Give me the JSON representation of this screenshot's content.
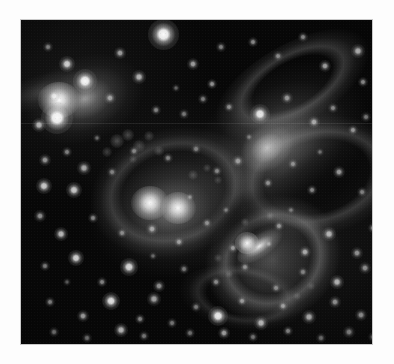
{
  "page": {
    "background_color": "#fdfdfd",
    "width": 394,
    "height": 364,
    "caption": ""
  },
  "image": {
    "alt_text": "Grayscale astronomical image of an interacting group of galaxies in a dense star field",
    "frame": {
      "x": 20,
      "y": 19,
      "width": 353,
      "height": 326
    },
    "border_color": "#c9c9c9",
    "background_color": "#070707",
    "palette": {
      "sky_black": "#070707",
      "faint_nebulosity": "#3a3a3a",
      "mid_gray": "#8e8e8e",
      "bright_gray": "#cfcfcf",
      "star_white": "#ffffff"
    },
    "scan_artifacts": {
      "vertical_striping": true,
      "horizontal_seam_y": 103,
      "grain": true,
      "vignette": true
    },
    "galaxies": [
      {
        "name": "elliptical-upper-left",
        "type": "elliptical",
        "center": {
          "x": 56,
          "y": 79
        },
        "radius": {
          "x": 62,
          "y": 42
        },
        "rotation_deg": -22,
        "core_brightness": "very-bright",
        "has_tidal_tail": true
      },
      {
        "name": "spiral-upper-right",
        "type": "spiral",
        "center": {
          "x": 243,
          "y": 128
        },
        "radius": {
          "x": 86,
          "y": 58
        },
        "rotation_deg": -38,
        "core_brightness": "diffuse-bright",
        "has_tidal_tail": true
      },
      {
        "name": "interacting-pair-center-a",
        "type": "interacting-core",
        "center": {
          "x": 128,
          "y": 184
        },
        "radius": {
          "x": 18,
          "y": 15
        },
        "rotation_deg": 0,
        "core_brightness": "very-bright",
        "has_tidal_tail": false
      },
      {
        "name": "interacting-pair-center-b",
        "type": "interacting-core",
        "center": {
          "x": 156,
          "y": 189
        },
        "radius": {
          "x": 17,
          "y": 14
        },
        "rotation_deg": 0,
        "core_brightness": "very-bright",
        "has_tidal_tail": false
      },
      {
        "name": "barred-spiral-lower-right",
        "type": "barred-spiral",
        "center": {
          "x": 243,
          "y": 234
        },
        "radius": {
          "x": 72,
          "y": 62
        },
        "rotation_deg": -30,
        "core_brightness": "bright",
        "has_tidal_tail": true
      }
    ],
    "stars": [
      {
        "x": 142,
        "y": 14,
        "r": 5.0,
        "b": 1.0
      },
      {
        "x": 46,
        "y": 44,
        "r": 2.6,
        "b": 0.82
      },
      {
        "x": 99,
        "y": 33,
        "r": 1.8,
        "b": 0.62
      },
      {
        "x": 118,
        "y": 57,
        "r": 2.2,
        "b": 0.7
      },
      {
        "x": 172,
        "y": 44,
        "r": 1.9,
        "b": 0.62
      },
      {
        "x": 191,
        "y": 64,
        "r": 1.7,
        "b": 0.58
      },
      {
        "x": 200,
        "y": 27,
        "r": 1.5,
        "b": 0.5
      },
      {
        "x": 232,
        "y": 22,
        "r": 1.6,
        "b": 0.54
      },
      {
        "x": 257,
        "y": 36,
        "r": 1.5,
        "b": 0.48
      },
      {
        "x": 282,
        "y": 17,
        "r": 1.6,
        "b": 0.52
      },
      {
        "x": 304,
        "y": 46,
        "r": 2.0,
        "b": 0.62
      },
      {
        "x": 337,
        "y": 31,
        "r": 2.4,
        "b": 0.74
      },
      {
        "x": 342,
        "y": 62,
        "r": 1.7,
        "b": 0.56
      },
      {
        "x": 27,
        "y": 27,
        "r": 1.6,
        "b": 0.52
      },
      {
        "x": 33,
        "y": 76,
        "r": 2.0,
        "b": 0.6
      },
      {
        "x": 18,
        "y": 105,
        "r": 2.3,
        "b": 0.7
      },
      {
        "x": 36,
        "y": 98,
        "r": 5.2,
        "b": 1.0
      },
      {
        "x": 64,
        "y": 61,
        "r": 4.0,
        "b": 0.98
      },
      {
        "x": 89,
        "y": 78,
        "r": 1.8,
        "b": 0.58
      },
      {
        "x": 135,
        "y": 90,
        "r": 1.6,
        "b": 0.5
      },
      {
        "x": 163,
        "y": 94,
        "r": 1.5,
        "b": 0.46
      },
      {
        "x": 182,
        "y": 79,
        "r": 1.5,
        "b": 0.48
      },
      {
        "x": 208,
        "y": 87,
        "r": 1.6,
        "b": 0.52
      },
      {
        "x": 239,
        "y": 94,
        "r": 3.3,
        "b": 0.92
      },
      {
        "x": 266,
        "y": 78,
        "r": 1.8,
        "b": 0.56
      },
      {
        "x": 293,
        "y": 102,
        "r": 1.9,
        "b": 0.6
      },
      {
        "x": 312,
        "y": 88,
        "r": 1.6,
        "b": 0.5
      },
      {
        "x": 332,
        "y": 110,
        "r": 1.7,
        "b": 0.54
      },
      {
        "x": 345,
        "y": 97,
        "r": 1.5,
        "b": 0.46
      },
      {
        "x": 24,
        "y": 140,
        "r": 1.8,
        "b": 0.58
      },
      {
        "x": 46,
        "y": 132,
        "r": 1.6,
        "b": 0.5
      },
      {
        "x": 63,
        "y": 148,
        "r": 2.1,
        "b": 0.66
      },
      {
        "x": 23,
        "y": 166,
        "r": 2.6,
        "b": 0.8
      },
      {
        "x": 53,
        "y": 170,
        "r": 2.6,
        "b": 0.8
      },
      {
        "x": 91,
        "y": 152,
        "r": 1.5,
        "b": 0.46
      },
      {
        "x": 113,
        "y": 131,
        "r": 1.6,
        "b": 0.48
      },
      {
        "x": 147,
        "y": 138,
        "r": 1.6,
        "b": 0.48
      },
      {
        "x": 175,
        "y": 129,
        "r": 1.5,
        "b": 0.44
      },
      {
        "x": 196,
        "y": 151,
        "r": 1.6,
        "b": 0.48
      },
      {
        "x": 217,
        "y": 141,
        "r": 1.8,
        "b": 0.55
      },
      {
        "x": 247,
        "y": 163,
        "r": 1.7,
        "b": 0.52
      },
      {
        "x": 272,
        "y": 144,
        "r": 1.6,
        "b": 0.48
      },
      {
        "x": 291,
        "y": 170,
        "r": 1.7,
        "b": 0.52
      },
      {
        "x": 318,
        "y": 152,
        "r": 1.9,
        "b": 0.6
      },
      {
        "x": 341,
        "y": 172,
        "r": 1.6,
        "b": 0.48
      },
      {
        "x": 19,
        "y": 196,
        "r": 1.8,
        "b": 0.56
      },
      {
        "x": 40,
        "y": 214,
        "r": 2.4,
        "b": 0.74
      },
      {
        "x": 72,
        "y": 198,
        "r": 1.7,
        "b": 0.52
      },
      {
        "x": 101,
        "y": 213,
        "r": 1.6,
        "b": 0.48
      },
      {
        "x": 131,
        "y": 209,
        "r": 1.8,
        "b": 0.58
      },
      {
        "x": 158,
        "y": 222,
        "r": 1.7,
        "b": 0.54
      },
      {
        "x": 186,
        "y": 203,
        "r": 1.6,
        "b": 0.48
      },
      {
        "x": 212,
        "y": 228,
        "r": 1.7,
        "b": 0.52
      },
      {
        "x": 258,
        "y": 206,
        "r": 1.7,
        "b": 0.52
      },
      {
        "x": 284,
        "y": 232,
        "r": 2.0,
        "b": 0.64
      },
      {
        "x": 308,
        "y": 214,
        "r": 2.2,
        "b": 0.7
      },
      {
        "x": 336,
        "y": 233,
        "r": 1.8,
        "b": 0.56
      },
      {
        "x": 352,
        "y": 208,
        "r": 1.7,
        "b": 0.52
      },
      {
        "x": 24,
        "y": 246,
        "r": 1.6,
        "b": 0.48
      },
      {
        "x": 55,
        "y": 238,
        "r": 2.7,
        "b": 0.84
      },
      {
        "x": 81,
        "y": 262,
        "r": 1.7,
        "b": 0.52
      },
      {
        "x": 108,
        "y": 247,
        "r": 2.8,
        "b": 0.86
      },
      {
        "x": 138,
        "y": 266,
        "r": 1.8,
        "b": 0.56
      },
      {
        "x": 163,
        "y": 249,
        "r": 1.6,
        "b": 0.46
      },
      {
        "x": 195,
        "y": 262,
        "r": 1.7,
        "b": 0.52
      },
      {
        "x": 224,
        "y": 247,
        "r": 1.6,
        "b": 0.48
      },
      {
        "x": 255,
        "y": 268,
        "r": 1.6,
        "b": 0.48
      },
      {
        "x": 282,
        "y": 252,
        "r": 1.6,
        "b": 0.46
      },
      {
        "x": 316,
        "y": 262,
        "r": 2.2,
        "b": 0.7
      },
      {
        "x": 344,
        "y": 248,
        "r": 1.8,
        "b": 0.56
      },
      {
        "x": 29,
        "y": 282,
        "r": 1.7,
        "b": 0.52
      },
      {
        "x": 62,
        "y": 296,
        "r": 1.9,
        "b": 0.6
      },
      {
        "x": 90,
        "y": 281,
        "r": 3.0,
        "b": 0.9
      },
      {
        "x": 119,
        "y": 299,
        "r": 1.7,
        "b": 0.52
      },
      {
        "x": 133,
        "y": 279,
        "r": 2.1,
        "b": 0.64
      },
      {
        "x": 151,
        "y": 303,
        "r": 1.6,
        "b": 0.46
      },
      {
        "x": 175,
        "y": 287,
        "r": 1.6,
        "b": 0.46
      },
      {
        "x": 197,
        "y": 296,
        "r": 3.3,
        "b": 0.94
      },
      {
        "x": 221,
        "y": 281,
        "r": 1.7,
        "b": 0.52
      },
      {
        "x": 240,
        "y": 303,
        "r": 2.2,
        "b": 0.7
      },
      {
        "x": 262,
        "y": 286,
        "r": 1.7,
        "b": 0.52
      },
      {
        "x": 288,
        "y": 297,
        "r": 2.1,
        "b": 0.66
      },
      {
        "x": 314,
        "y": 282,
        "r": 1.8,
        "b": 0.56
      },
      {
        "x": 340,
        "y": 295,
        "r": 1.9,
        "b": 0.6
      },
      {
        "x": 33,
        "y": 312,
        "r": 1.6,
        "b": 0.46
      },
      {
        "x": 66,
        "y": 318,
        "r": 1.6,
        "b": 0.44
      },
      {
        "x": 100,
        "y": 310,
        "r": 2.3,
        "b": 0.72
      },
      {
        "x": 123,
        "y": 316,
        "r": 1.6,
        "b": 0.46
      },
      {
        "x": 169,
        "y": 313,
        "r": 1.6,
        "b": 0.44
      },
      {
        "x": 203,
        "y": 313,
        "r": 2.0,
        "b": 0.62
      },
      {
        "x": 232,
        "y": 317,
        "r": 1.6,
        "b": 0.44
      },
      {
        "x": 267,
        "y": 311,
        "r": 1.7,
        "b": 0.5
      },
      {
        "x": 300,
        "y": 318,
        "r": 1.6,
        "b": 0.44
      },
      {
        "x": 328,
        "y": 312,
        "r": 1.8,
        "b": 0.54
      },
      {
        "x": 352,
        "y": 317,
        "r": 1.6,
        "b": 0.44
      },
      {
        "x": 76,
        "y": 118,
        "r": 1.4,
        "b": 0.4
      },
      {
        "x": 155,
        "y": 68,
        "r": 1.4,
        "b": 0.38
      },
      {
        "x": 228,
        "y": 117,
        "r": 1.4,
        "b": 0.38
      },
      {
        "x": 299,
        "y": 132,
        "r": 1.4,
        "b": 0.38
      },
      {
        "x": 169,
        "y": 177,
        "r": 1.4,
        "b": 0.4
      },
      {
        "x": 205,
        "y": 190,
        "r": 1.4,
        "b": 0.38
      },
      {
        "x": 270,
        "y": 190,
        "r": 1.4,
        "b": 0.38
      },
      {
        "x": 132,
        "y": 236,
        "r": 1.4,
        "b": 0.38
      },
      {
        "x": 46,
        "y": 262,
        "r": 1.3,
        "b": 0.34
      },
      {
        "x": 248,
        "y": 224,
        "r": 1.4,
        "b": 0.38
      }
    ],
    "knots": [
      {
        "x": 96,
        "y": 121,
        "r": 3.2,
        "b": 0.3
      },
      {
        "x": 107,
        "y": 115,
        "r": 2.8,
        "b": 0.28
      },
      {
        "x": 118,
        "y": 126,
        "r": 2.6,
        "b": 0.26
      },
      {
        "x": 128,
        "y": 116,
        "r": 2.4,
        "b": 0.24
      },
      {
        "x": 86,
        "y": 132,
        "r": 2.4,
        "b": 0.24
      },
      {
        "x": 138,
        "y": 131,
        "r": 2.2,
        "b": 0.22
      },
      {
        "x": 112,
        "y": 139,
        "r": 2.0,
        "b": 0.2
      },
      {
        "x": 172,
        "y": 155,
        "r": 2.2,
        "b": 0.24
      },
      {
        "x": 186,
        "y": 148,
        "r": 2.0,
        "b": 0.22
      },
      {
        "x": 197,
        "y": 160,
        "r": 1.9,
        "b": 0.2
      },
      {
        "x": 224,
        "y": 202,
        "r": 2.0,
        "b": 0.22
      },
      {
        "x": 249,
        "y": 196,
        "r": 1.9,
        "b": 0.2
      },
      {
        "x": 208,
        "y": 254,
        "r": 2.0,
        "b": 0.22
      },
      {
        "x": 197,
        "y": 238,
        "r": 1.8,
        "b": 0.2
      },
      {
        "x": 276,
        "y": 276,
        "r": 1.8,
        "b": 0.2
      },
      {
        "x": 290,
        "y": 266,
        "r": 1.7,
        "b": 0.18
      }
    ]
  }
}
